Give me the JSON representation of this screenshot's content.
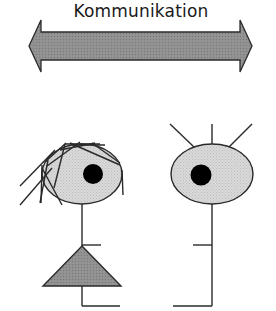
{
  "diagram": {
    "title": "Kommunikation",
    "arrow": {
      "type": "double-headed",
      "fill": "#8f8f8f",
      "stroke": "#2b2b2b"
    },
    "figures": [
      {
        "id": "left",
        "description": "stick figure with scribbled hair, one eye, and triangle skirt",
        "head_fill": "#d6d6d6",
        "eye_fill": "#000000",
        "body_fill": "#8a8a8a"
      },
      {
        "id": "right",
        "description": "stick figure with three antennae and one eye",
        "head_fill": "#d6d6d6",
        "eye_fill": "#000000"
      }
    ]
  }
}
